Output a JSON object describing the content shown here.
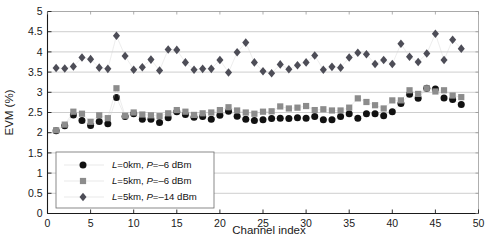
{
  "chart_data": {
    "type": "scatter",
    "title": "",
    "xlabel": "Channel index",
    "ylabel": "EVM (%)",
    "xlim": [
      0,
      50
    ],
    "ylim": [
      0,
      5
    ],
    "xticks": [
      0,
      5,
      10,
      15,
      20,
      25,
      30,
      35,
      40,
      45,
      50
    ],
    "yticks": [
      0,
      0.5,
      1,
      1.5,
      2,
      2.5,
      3,
      3.5,
      4,
      4.5,
      5
    ],
    "grid": true,
    "legend_position": "lower-left",
    "x": [
      1,
      2,
      3,
      4,
      5,
      6,
      7,
      8,
      9,
      10,
      11,
      12,
      13,
      14,
      15,
      16,
      17,
      18,
      19,
      20,
      21,
      22,
      23,
      24,
      25,
      26,
      27,
      28,
      29,
      30,
      31,
      32,
      33,
      34,
      35,
      36,
      37,
      38,
      39,
      40,
      41,
      42,
      43,
      44,
      45,
      46,
      47,
      48
    ],
    "series": [
      {
        "name": "L=0km, P=-6 dBm",
        "marker": "circle",
        "color": "#111111",
        "values": [
          2.05,
          2.17,
          2.44,
          2.3,
          2.18,
          2.28,
          2.22,
          2.87,
          2.4,
          2.47,
          2.33,
          2.33,
          2.25,
          2.37,
          2.52,
          2.45,
          2.38,
          2.4,
          2.33,
          2.43,
          2.53,
          2.41,
          2.33,
          2.3,
          2.32,
          2.35,
          2.36,
          2.35,
          2.37,
          2.36,
          2.4,
          2.32,
          2.32,
          2.4,
          2.47,
          2.36,
          2.47,
          2.47,
          2.42,
          2.52,
          2.72,
          2.95,
          2.85,
          3.1,
          3.08,
          2.86,
          2.82,
          2.7
        ]
      },
      {
        "name": "L=5km, P=-6 dBm",
        "marker": "square",
        "color": "#8c8c8c",
        "values": [
          2.06,
          2.2,
          2.52,
          2.47,
          2.27,
          2.43,
          2.36,
          3.1,
          2.42,
          2.5,
          2.45,
          2.43,
          2.41,
          2.48,
          2.56,
          2.52,
          2.44,
          2.48,
          2.5,
          2.56,
          2.63,
          2.55,
          2.5,
          2.47,
          2.52,
          2.53,
          2.65,
          2.6,
          2.62,
          2.66,
          2.56,
          2.58,
          2.55,
          2.55,
          2.62,
          2.85,
          2.76,
          2.68,
          2.6,
          2.8,
          2.8,
          3.05,
          2.96,
          3.1,
          3.02,
          3.05,
          2.92,
          2.88
        ]
      },
      {
        "name": "L=5km, P=-14 dBm",
        "marker": "diamond",
        "color": "#4d4d57",
        "values": [
          3.6,
          3.59,
          3.64,
          3.86,
          3.82,
          3.61,
          3.58,
          4.4,
          3.9,
          3.56,
          3.62,
          3.81,
          3.54,
          4.06,
          4.05,
          3.74,
          3.56,
          3.58,
          3.58,
          3.8,
          3.49,
          3.99,
          4.23,
          3.74,
          3.52,
          3.47,
          3.69,
          3.57,
          3.67,
          3.74,
          3.91,
          3.56,
          3.63,
          3.61,
          3.86,
          3.98,
          3.94,
          3.7,
          3.8,
          3.7,
          4.2,
          3.88,
          3.75,
          3.96,
          4.45,
          3.8,
          4.3,
          4.08
        ]
      }
    ]
  },
  "legend": {
    "entries": [
      {
        "prefix": "L",
        "text": "=0km, ",
        "prefix2": "P",
        "text2": "=–6 dBm"
      },
      {
        "prefix": "L",
        "text": "=5km, ",
        "prefix2": "P",
        "text2": "=–6 dBm"
      },
      {
        "prefix": "L",
        "text": "=5km, ",
        "prefix2": "P",
        "text2": "=–14 dBm"
      }
    ]
  },
  "ticklabels": {
    "x": [
      "0",
      "5",
      "10",
      "15",
      "20",
      "25",
      "30",
      "35",
      "40",
      "45",
      "50"
    ],
    "y": [
      "0",
      "0.5",
      "1",
      "1.5",
      "2",
      "2.5",
      "3",
      "3.5",
      "4",
      "4.5",
      "5"
    ]
  },
  "labels": {
    "xlabel": "Channel index",
    "ylabel": "EVM (%)"
  }
}
